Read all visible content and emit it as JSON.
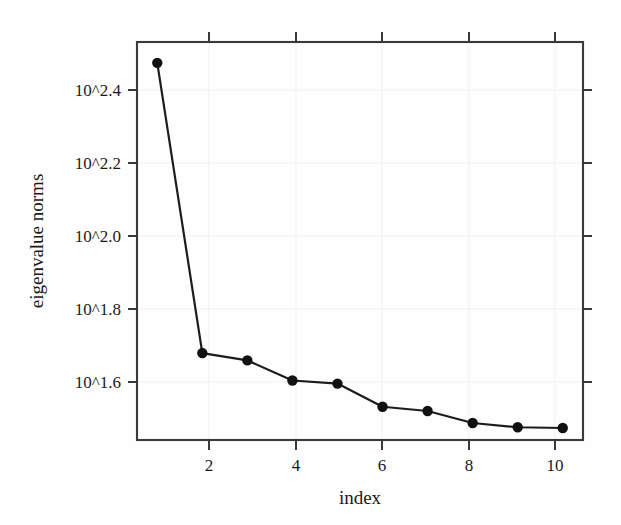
{
  "chart_data": {
    "type": "line",
    "title": "",
    "subtitle": "",
    "xlabel": "index",
    "ylabel": "eigenvalue norms",
    "x": [
      1,
      2,
      3,
      4,
      5,
      6,
      7,
      8,
      9,
      10
    ],
    "values": [
      2.466,
      1.715,
      1.696,
      1.644,
      1.636,
      1.576,
      1.565,
      1.534,
      1.523,
      1.521
    ],
    "value_scale": "log10-exponent",
    "series": [
      {
        "name": "eigenvalue norms",
        "values": [
          2.466,
          1.715,
          1.696,
          1.644,
          1.636,
          1.576,
          1.565,
          1.534,
          1.523,
          1.521
        ]
      }
    ],
    "xlim": [
      0.55,
      10.45
    ],
    "ylim": [
      1.49,
      2.52
    ],
    "xticks": [
      2,
      4,
      6,
      8,
      10
    ],
    "xticklabels": [
      "2",
      "4",
      "6",
      "8",
      "10"
    ],
    "yticks": [
      2.4,
      2.2,
      2.0,
      1.8,
      1.6
    ],
    "yticklabels": [
      "10^2.4",
      "10^2.2",
      "10^2.0",
      "10^1.8",
      "10^1.6"
    ],
    "grid": true,
    "grid_color": "#f1f1f1",
    "legend": null,
    "legend_position": "none",
    "marker": "filled-circle",
    "line_color": "#1c1c1c",
    "marker_color": "#111111",
    "frame_color": "#3a3a3a",
    "background_color": "#fefefe",
    "ticks_all_sides": true,
    "annotations": []
  },
  "figure": {
    "x_axis_title": "index",
    "y_axis_title": "eigenvalue norms"
  }
}
